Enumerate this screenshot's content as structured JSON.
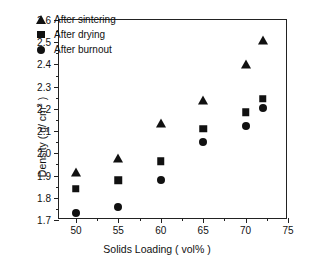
{
  "chart_data": {
    "type": "scatter",
    "title": "",
    "xlabel": "Solids Loading ( vol% )",
    "ylabel": "Density ( g/ cm3 )",
    "ylabel_main": "Density ( g/ cm",
    "ylabel_sup": "3",
    "ylabel_tail": " )",
    "xlim": [
      48,
      75
    ],
    "ylim": [
      1.7,
      2.6
    ],
    "grid": false,
    "legend_position": "top-left",
    "x": [
      50,
      55,
      60,
      65,
      70,
      72
    ],
    "xticks": [
      "50",
      "55",
      "60",
      "65",
      "70",
      "75"
    ],
    "xtick_values": [
      50,
      55,
      60,
      65,
      70,
      75
    ],
    "xminor_values": [
      52.5,
      57.5,
      62.5,
      67.5,
      72.5
    ],
    "yticks": [
      "2.6",
      "2.5",
      "2.4",
      "2.3",
      "2.2",
      "2.1",
      "2.0",
      "1.9",
      "1.8",
      "1.7"
    ],
    "ytick_values": [
      2.6,
      2.5,
      2.4,
      2.3,
      2.2,
      2.1,
      2.0,
      1.9,
      1.8,
      1.7
    ],
    "yminor_values": [
      2.55,
      2.45,
      2.35,
      2.25,
      2.15,
      2.05,
      1.95,
      1.85,
      1.75
    ],
    "series": [
      {
        "name": "After sintering",
        "marker": "triangle",
        "color": "#111111",
        "values": [
          1.915,
          1.98,
          2.135,
          2.24,
          2.4,
          2.51
        ]
      },
      {
        "name": "After drying",
        "marker": "square",
        "color": "#111111",
        "values": [
          1.84,
          1.88,
          1.965,
          2.11,
          2.185,
          2.245
        ]
      },
      {
        "name": "After burnout",
        "marker": "circle",
        "color": "#111111",
        "values": [
          1.73,
          1.76,
          1.88,
          2.05,
          2.125,
          2.205
        ]
      }
    ]
  }
}
